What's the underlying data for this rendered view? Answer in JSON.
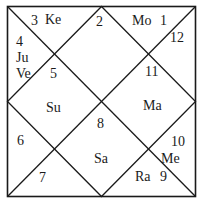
{
  "chart": {
    "style": "North Indian birth chart",
    "line_color": "#1a1a1a",
    "houses": [
      {
        "sign": "1",
        "planets": "Mo"
      },
      {
        "sign": "2",
        "planets": ""
      },
      {
        "sign": "3",
        "planets": "Ke"
      },
      {
        "sign": "4",
        "planets": "Ju Ve"
      },
      {
        "sign": "5",
        "planets": ""
      },
      {
        "sign": "6",
        "planets": ""
      },
      {
        "sign": "7",
        "planets": ""
      },
      {
        "sign": "8",
        "planets": "Sa"
      },
      {
        "sign": "9",
        "planets": "Ra"
      },
      {
        "sign": "10",
        "planets": "Me"
      },
      {
        "sign": "11",
        "planets": "Ma"
      },
      {
        "sign": "12",
        "planets": ""
      }
    ],
    "labels": {
      "n1": "1",
      "n2": "2",
      "n3": "3",
      "n4": "4",
      "n5": "5",
      "n6": "6",
      "n7": "7",
      "n8": "8",
      "n9": "9",
      "n10": "10",
      "n11": "11",
      "n12": "12",
      "mo": "Mo",
      "ke": "Ke",
      "ju": "Ju",
      "ve": "Ve",
      "su": "Su",
      "ma": "Ma",
      "sa": "Sa",
      "me": "Me",
      "ra": "Ra"
    }
  }
}
